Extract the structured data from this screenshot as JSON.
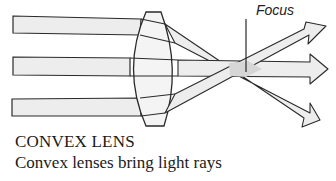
{
  "diagram": {
    "focus_label": "Focus",
    "colors": {
      "beam_fill": "#ededed",
      "overlap_fill": "#d6d6d6",
      "stroke": "#2a2a2a",
      "lens_fill": "#f4f4f4"
    }
  },
  "caption": {
    "title": "CONVEX LENS",
    "text": "Convex lenses bring light rays"
  }
}
